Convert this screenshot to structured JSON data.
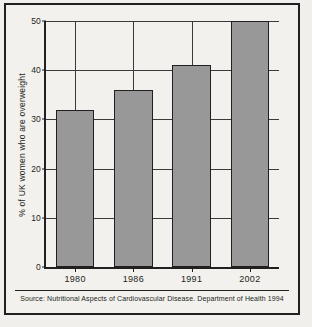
{
  "chart_data": {
    "type": "bar",
    "title": "",
    "subtitle": "",
    "categories": [
      "1980",
      "1986",
      "1991",
      "2002"
    ],
    "values": [
      32,
      36,
      41,
      50
    ],
    "series": [
      {
        "name": "% of UK women who are overweight",
        "values": [
          32,
          36,
          41,
          50
        ]
      }
    ],
    "xlabel": "",
    "ylabel": "% of UK women who are overweight",
    "ylim": [
      0,
      50
    ],
    "yticks": [
      0,
      10,
      20,
      30,
      40,
      50
    ],
    "ytick_labels": [
      "0",
      "10",
      "20",
      "30",
      "40",
      "50"
    ],
    "xtick_labels": [
      "1980",
      "1986",
      "1991",
      "2002"
    ],
    "grid": "horizontal-and-vertical",
    "legend": "none",
    "bar_color": "#989898",
    "bar_edge_color": "#231f20",
    "axis_color": "#231f20",
    "background_color": "#f2f1ee",
    "frame_color": "#231f20",
    "source_note": "Source: Nutritional Aspects of Cardiovascular Disease. Department of Health 1994"
  }
}
